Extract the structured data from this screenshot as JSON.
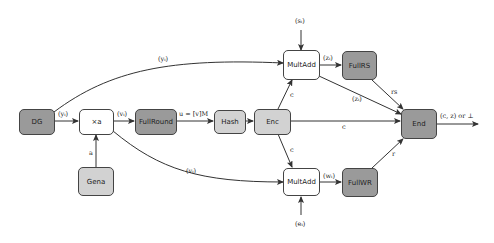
{
  "nodes": {
    "dg": "DG",
    "xa": "×a",
    "fullround": "FullRound",
    "hash": "Hash",
    "enc": "Enc",
    "multadd_top": "MultAdd",
    "fullrs": "FullRS",
    "end": "End",
    "gena": "Gena",
    "multadd_bottom": "MultAdd",
    "fullwr": "FullWR"
  },
  "edges": {
    "dg_to_xa": "(yᵢ)",
    "dg_to_multadd_top": "(yᵢ)",
    "xa_to_fullround": "(vᵢ)",
    "xa_to_multadd_bottom": "(vᵢ)",
    "fullround_to_hash": "u = [v]M",
    "gena_to_xa": "a",
    "enc_to_multadd_top": "c",
    "enc_to_end": "c",
    "enc_to_multadd_bottom": "c",
    "si_input": "(sᵢ)",
    "multadd_top_to_fullrs": "(zᵢ)",
    "multadd_top_to_end": "(zᵢ)",
    "fullrs_to_end": "rs",
    "ei_input": "(eᵢ)",
    "multadd_bottom_to_fullwr": "(wᵢ)",
    "fullwr_to_end": "r",
    "end_output": "(c, z) or ⊥"
  },
  "colors": {
    "dark_node": "#9a9a9a",
    "light_node": "#d2d2d2",
    "white_node": "#ffffff",
    "stroke": "#444444"
  }
}
